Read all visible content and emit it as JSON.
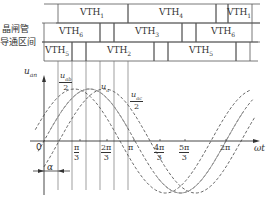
{
  "left_label": {
    "line1": "晶闸管",
    "line2": "导通区间"
  },
  "rows": [
    {
      "segments": [
        {
          "label": "VTH",
          "sub": "1",
          "x1": 58,
          "x2": 128
        },
        {
          "label": "VTH",
          "sub": "4",
          "x1": 128,
          "x2": 216
        },
        {
          "label": "",
          "sub": "",
          "x1": 216,
          "x2": 228
        },
        {
          "label": "VTH",
          "sub": "1",
          "x1": 228,
          "x2": 252
        }
      ]
    },
    {
      "segments": [
        {
          "label": "VTH",
          "sub": "6",
          "x1": 44,
          "x2": 100
        },
        {
          "label": "",
          "sub": "",
          "x1": 100,
          "x2": 114
        },
        {
          "label": "VTH",
          "sub": "3",
          "x1": 114,
          "x2": 182
        },
        {
          "label": "",
          "sub": "",
          "x1": 182,
          "x2": 196
        },
        {
          "label": "VTH",
          "sub": "6",
          "x1": 196,
          "x2": 252
        }
      ]
    },
    {
      "segments": [
        {
          "label": "VTH",
          "sub": "5",
          "x1": 44,
          "x2": 72
        },
        {
          "label": "",
          "sub": "",
          "x1": 72,
          "x2": 86
        },
        {
          "label": "VTH",
          "sub": "2",
          "x1": 86,
          "x2": 154
        },
        {
          "label": "",
          "sub": "",
          "x1": 154,
          "x2": 168
        },
        {
          "label": "VTH",
          "sub": "5",
          "x1": 168,
          "x2": 236
        },
        {
          "label": "",
          "sub": "",
          "x1": 236,
          "x2": 250
        }
      ]
    }
  ],
  "axes": {
    "y_label": "u",
    "y_label_sub": "an",
    "x_label": "ωt",
    "origin_label": "0"
  },
  "x_ticks": [
    {
      "num": "π",
      "den": "3",
      "x": 80
    },
    {
      "num": "2π",
      "den": "3",
      "x": 107
    },
    {
      "num": "π",
      "den": "",
      "x": 134
    },
    {
      "num": "4π",
      "den": "3",
      "x": 160
    },
    {
      "num": "5π",
      "den": "3",
      "x": 185
    },
    {
      "num": "2π",
      "den": "",
      "x": 226
    }
  ],
  "curve_labels": {
    "uab": {
      "num": "u",
      "num_sub": "ab",
      "den": "2"
    },
    "ua": {
      "text": "u",
      "sub": "a"
    },
    "uac": {
      "num": "u",
      "num_sub": "ac",
      "den": "2"
    }
  },
  "alpha_label": "α"
}
